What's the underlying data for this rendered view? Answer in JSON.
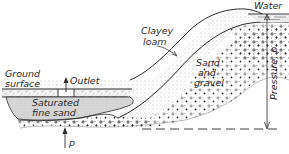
{
  "figure": {
    "type": "geologic cross-section",
    "labels": {
      "water": "Water",
      "clayey_loam_1": "Clayey",
      "clayey_loam_2": "loam",
      "sand_gravel_1": "Sand",
      "sand_gravel_2": "and",
      "sand_gravel_3": "gravel",
      "ground_surface_1": "Ground",
      "ground_surface_2": "surface",
      "outlet": "Outlet",
      "saturated_1": "Saturated",
      "saturated_2": "fine sand",
      "pressure": "Pressure, p",
      "p": "p"
    },
    "colors": {
      "line": "#2a2a2a",
      "stipple": "#8a8a8a",
      "saturated_fill": "#d4d4d4",
      "background": "#ffffff"
    }
  }
}
